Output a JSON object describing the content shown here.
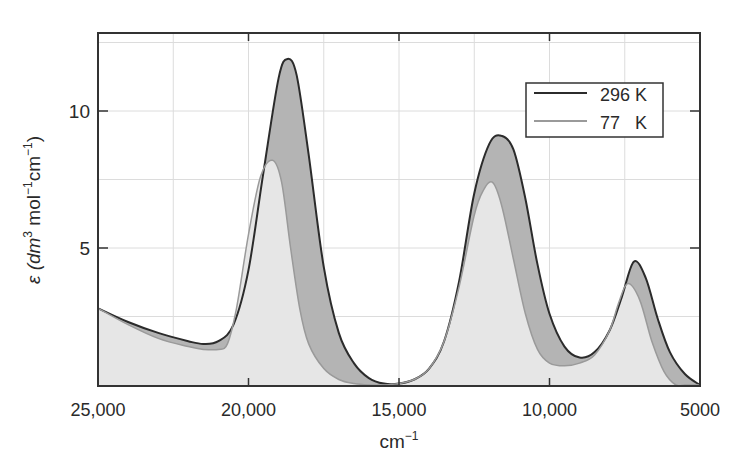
{
  "chart_data": {
    "type": "area",
    "title": "",
    "xlabel": "cm⁻¹",
    "ylabel": "ε (dm³ mol⁻¹cm⁻¹)",
    "xlim": [
      25000,
      5000
    ],
    "ylim": [
      0,
      12.5
    ],
    "x_reversed": true,
    "x_ticks": [
      25000,
      20000,
      15000,
      10000,
      5000
    ],
    "x_tick_labels": [
      "25,000",
      "20,000",
      "15,000",
      "10,000",
      "5000"
    ],
    "y_ticks": [
      5,
      10
    ],
    "y_tick_labels": [
      "5",
      "10"
    ],
    "grid": true,
    "grid_x_step": 2500,
    "grid_y_step": 2.5,
    "legend_position": "upper right",
    "series": [
      {
        "name": "296 K",
        "color": "#2b2b2b",
        "fill": "#b4b4b4",
        "x": [
          25000,
          24000,
          23000,
          22000,
          21500,
          21000,
          20500,
          20000,
          19500,
          19000,
          18700,
          18400,
          18000,
          17500,
          17000,
          16500,
          16000,
          15500,
          15000,
          14500,
          14000,
          13500,
          13000,
          12500,
          12000,
          11600,
          11200,
          10800,
          10400,
          10000,
          9500,
          9000,
          8500,
          8000,
          7600,
          7200,
          6800,
          6400,
          6000,
          5500,
          5000
        ],
        "values": [
          2.8,
          2.3,
          1.9,
          1.6,
          1.5,
          1.6,
          2.2,
          4.2,
          7.8,
          11.2,
          11.9,
          11.3,
          8.4,
          4.3,
          1.9,
          0.8,
          0.25,
          0.05,
          0.05,
          0.2,
          0.6,
          1.6,
          3.8,
          7.0,
          8.8,
          9.1,
          8.6,
          6.8,
          4.4,
          2.6,
          1.4,
          1.0,
          1.2,
          2.0,
          3.2,
          4.5,
          3.9,
          2.4,
          1.2,
          0.4,
          0.0
        ]
      },
      {
        "name": "77   K",
        "color": "#9a9a9a",
        "fill": "#e6e6e6",
        "x": [
          25000,
          24000,
          23000,
          22000,
          21500,
          21000,
          20700,
          20400,
          20000,
          19600,
          19200,
          18900,
          18600,
          18300,
          18000,
          17500,
          17000,
          16500,
          16000,
          15500,
          15000,
          14500,
          14000,
          13500,
          13000,
          12500,
          12200,
          11900,
          11600,
          11200,
          10800,
          10400,
          10000,
          9500,
          9000,
          8500,
          8000,
          7700,
          7400,
          7000,
          6600,
          6200,
          5800,
          5500,
          5000
        ],
        "values": [
          2.8,
          2.2,
          1.7,
          1.4,
          1.3,
          1.3,
          1.5,
          2.8,
          5.5,
          7.6,
          8.2,
          7.4,
          5.0,
          2.8,
          1.5,
          0.6,
          0.2,
          0.05,
          0.0,
          0.0,
          0.05,
          0.2,
          0.6,
          1.6,
          3.6,
          6.2,
          7.1,
          7.4,
          6.6,
          4.6,
          2.6,
          1.3,
          0.8,
          0.7,
          0.8,
          1.1,
          2.0,
          3.0,
          3.7,
          3.1,
          1.6,
          0.5,
          0.0,
          0.0,
          0.0
        ]
      }
    ]
  },
  "legend": {
    "items": [
      {
        "label": "296 K",
        "color": "#2b2b2b"
      },
      {
        "label": "77   K",
        "color": "#9a9a9a"
      }
    ]
  },
  "axes": {
    "xlabel": "cm⁻¹",
    "ylabel_prefix": "ε (dm",
    "ylabel_sup1": "3",
    "ylabel_mid1": " mol",
    "ylabel_sup2": "−1",
    "ylabel_mid2": "cm",
    "ylabel_sup3": "−1",
    "ylabel_suffix": ")",
    "x_unit_base": "cm",
    "x_unit_sup": "−1"
  }
}
